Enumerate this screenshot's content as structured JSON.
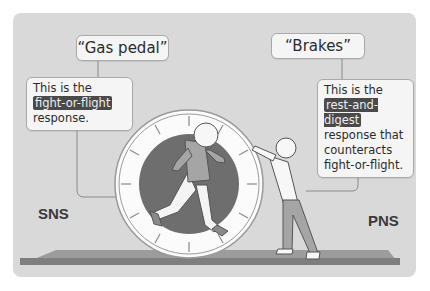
{
  "diagram": {
    "left": {
      "title": "“Gas pedal”",
      "desc_prefix": "This is the",
      "desc_highlight": "fight-or-flight",
      "desc_suffix": "response.",
      "system_label": "SNS"
    },
    "right": {
      "title": "“Brakes”",
      "desc_prefix": "This is the",
      "desc_highlight": "rest-and-digest",
      "desc_line3": "response that",
      "desc_line4": "counteracts",
      "desc_line5": "fight-or-flight.",
      "system_label": "PNS"
    },
    "illustration": {
      "left_figure": "running person inside hamster wheel",
      "right_figure": "person pushing against wheel to stop it",
      "platform": "gray floor platform"
    },
    "colors": {
      "panel_bg": "#d9d9d9",
      "wheel_inner": "#6e6e6e",
      "wheel_rim": "#f7f7f7",
      "platform_top": "#9c9c9c",
      "platform_front": "#7f7f7f",
      "highlight_bg": "#4a4a4a"
    }
  }
}
